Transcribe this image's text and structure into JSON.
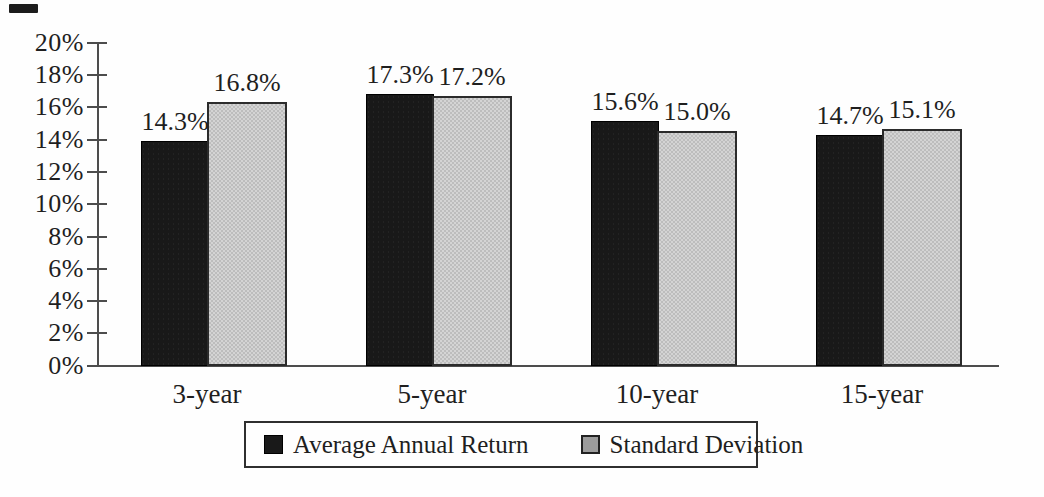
{
  "chart_data": {
    "type": "bar",
    "categories": [
      "3-year",
      "5-year",
      "10-year",
      "15-year"
    ],
    "series": [
      {
        "name": "Average Annual Return",
        "color": "#191919",
        "values": [
          14.3,
          17.3,
          15.6,
          14.7
        ],
        "data_labels": [
          "14.3%",
          "17.3%",
          "15.6%",
          "14.7%"
        ]
      },
      {
        "name": "Standard Deviation",
        "color": "#c9c9c9",
        "values": [
          16.8,
          17.2,
          15.0,
          15.1
        ],
        "data_labels": [
          "16.8%",
          "17.2%",
          "15.0%",
          "15.1%"
        ]
      }
    ],
    "title": "",
    "xlabel": "",
    "ylabel": "",
    "ylim": [
      0,
      20
    ],
    "ytick_step": 2,
    "grid": false,
    "legend_position": "bottom"
  },
  "y_axis": {
    "tick_labels": [
      "20%",
      "18%",
      "16%",
      "14%",
      "12%",
      "10%",
      "8%",
      "6%",
      "4%",
      "2%",
      "0%"
    ]
  },
  "x_axis": {
    "category_labels": [
      "3-year",
      "5-year",
      "10-year",
      "15-year"
    ]
  },
  "legend": {
    "items": [
      {
        "label": "Average Annual Return",
        "swatch": "black-square-icon"
      },
      {
        "label": "Standard Deviation",
        "swatch": "gray-square-icon"
      }
    ]
  },
  "colors": {
    "bar_black": "#191919",
    "bar_gray": "#c9c9c9",
    "axis": "#4d4d4d",
    "text": "#1f1f1f"
  }
}
